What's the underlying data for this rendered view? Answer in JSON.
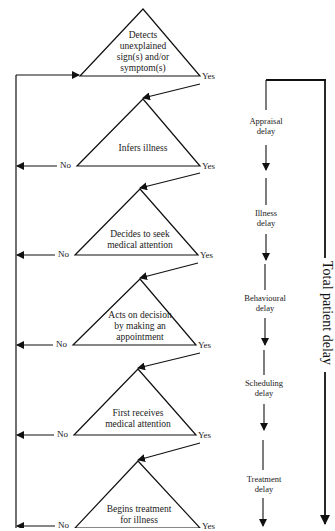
{
  "diagram": {
    "stages": [
      {
        "label": "Detects unexplained sign(s) and/or symptom(s)",
        "lines": [
          "Detects",
          "unexplained",
          "sign(s) and/or",
          "symptom(s)"
        ],
        "yes": "Yes",
        "no": ""
      },
      {
        "label": "Infers illness",
        "lines": [
          "Infers illness"
        ],
        "yes": "Yes",
        "no": "No"
      },
      {
        "label": "Decides to seek medical attention",
        "lines": [
          "Decides to seek",
          "medical attention"
        ],
        "yes": "Yes",
        "no": "No"
      },
      {
        "label": "Acts on decision by making an appointment",
        "lines": [
          "Acts on decision",
          "by making an",
          "appointment"
        ],
        "yes": "Yes",
        "no": "No"
      },
      {
        "label": "First receives medical attention",
        "lines": [
          "First receives",
          "medical attention"
        ],
        "yes": "Yes",
        "no": "No"
      },
      {
        "label": "Begins treatment for illness",
        "lines": [
          "Begins treatment",
          "for illness"
        ],
        "yes": "Yes",
        "no": "No"
      }
    ],
    "delays": [
      {
        "line1": "Appraisal",
        "line2": "delay"
      },
      {
        "line1": "Illness",
        "line2": "delay"
      },
      {
        "line1": "Behavioural",
        "line2": "delay"
      },
      {
        "line1": "Scheduling",
        "line2": "delay"
      },
      {
        "line1": "Treatment",
        "line2": "delay"
      }
    ],
    "total_label": "Total patient delay",
    "line_color": "#111111"
  }
}
